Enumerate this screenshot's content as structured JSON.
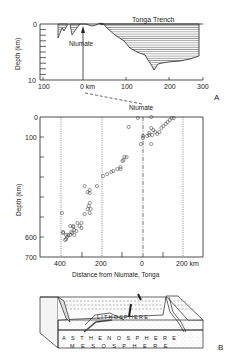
{
  "panel_a": {
    "label": "A",
    "title": "Tonga Trench",
    "ylabel": "Depth (km)",
    "y_ticks": [
      "0",
      "10"
    ],
    "x_ticks": [
      "100",
      "0 km",
      "100",
      "200",
      "300"
    ],
    "marker_label": "Niumate",
    "dashed_link_label": "Niumate"
  },
  "panel_scatter": {
    "ylabel": "Depth (km)",
    "xlabel": "Distance from Niumate, Tonga",
    "y_ticks": [
      "0",
      "100",
      "600",
      "700"
    ],
    "x_ticks": [
      "400",
      "200",
      "0",
      "200 km"
    ]
  },
  "panel_b": {
    "label": "B",
    "layers": [
      "LITHOSPHERE",
      "ASTHENOSPHERE",
      "MESOSPHERE"
    ]
  },
  "chart_data": [
    {
      "type": "area",
      "title": "Tonga Trench",
      "xlabel": "",
      "ylabel": "Depth (km)",
      "xlim": [
        -100,
        300
      ],
      "ylim": [
        10,
        0
      ],
      "x": [
        -60,
        -50,
        -40,
        -35,
        -25,
        -10,
        0,
        10,
        25,
        35,
        45,
        60,
        80,
        100,
        115,
        130,
        145,
        155,
        162,
        170,
        180,
        200,
        240,
        280
      ],
      "values": [
        3,
        0.6,
        0.2,
        2.3,
        0.2,
        0.1,
        0,
        0.1,
        0.5,
        0.1,
        0.8,
        2.2,
        3.5,
        4.8,
        6.3,
        6.8,
        7.5,
        8.8,
        9.5,
        8.7,
        8.0,
        7.6,
        7.2,
        6.3
      ],
      "annotations": [
        "Niumate (x=0)",
        "Tonga Trench"
      ]
    },
    {
      "type": "scatter",
      "title": "",
      "xlabel": "Distance from Niumate, Tonga",
      "ylabel": "Depth (km)",
      "xlim": [
        450,
        -250
      ],
      "ylim": [
        700,
        0
      ],
      "x_tick_values": [
        400,
        200,
        0,
        -200
      ],
      "y_tick_values": [
        0,
        100,
        600,
        700
      ],
      "grid_x": [
        400,
        200,
        0,
        -200
      ],
      "points": [
        [
          -40,
          0
        ],
        [
          -140,
          5
        ],
        [
          -150,
          5
        ],
        [
          -130,
          15
        ],
        [
          -120,
          25
        ],
        [
          -110,
          35
        ],
        [
          -100,
          45
        ],
        [
          -90,
          55
        ],
        [
          -80,
          75
        ],
        [
          -50,
          65
        ],
        [
          -40,
          55
        ],
        [
          -60,
          75
        ],
        [
          -70,
          85
        ],
        [
          -45,
          90
        ],
        [
          -30,
          90
        ],
        [
          -20,
          95
        ],
        [
          -30,
          80
        ],
        [
          -40,
          135
        ],
        [
          0,
          95
        ],
        [
          0,
          105
        ],
        [
          25,
          5
        ],
        [
          10,
          135
        ],
        [
          70,
          50
        ],
        [
          80,
          200
        ],
        [
          90,
          200
        ],
        [
          95,
          215
        ],
        [
          100,
          220
        ],
        [
          110,
          250
        ],
        [
          110,
          260
        ],
        [
          125,
          260
        ],
        [
          145,
          270
        ],
        [
          155,
          275
        ],
        [
          175,
          285
        ],
        [
          195,
          295
        ],
        [
          225,
          345
        ],
        [
          260,
          365
        ],
        [
          285,
          345
        ],
        [
          270,
          375
        ],
        [
          260,
          380
        ],
        [
          260,
          430
        ],
        [
          265,
          445
        ],
        [
          255,
          460
        ],
        [
          270,
          460
        ],
        [
          260,
          480
        ],
        [
          285,
          485
        ],
        [
          300,
          530
        ],
        [
          320,
          530
        ],
        [
          340,
          545
        ],
        [
          355,
          545
        ],
        [
          335,
          565
        ],
        [
          340,
          550
        ],
        [
          350,
          575
        ],
        [
          355,
          590
        ],
        [
          365,
          590
        ],
        [
          370,
          600
        ],
        [
          375,
          610
        ],
        [
          380,
          615
        ],
        [
          375,
          590
        ],
        [
          335,
          590
        ],
        [
          310,
          545
        ],
        [
          325,
          570
        ],
        [
          390,
          580
        ],
        [
          345,
          580
        ],
        [
          300,
          555
        ],
        [
          395,
          480
        ],
        [
          390,
          575
        ]
      ]
    }
  ]
}
